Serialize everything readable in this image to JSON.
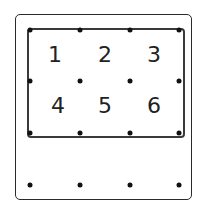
{
  "diagram": {
    "title": "",
    "digits": [
      {
        "label": "1",
        "x": 55,
        "y": 55
      },
      {
        "label": "2",
        "x": 105,
        "y": 55
      },
      {
        "label": "3",
        "x": 154,
        "y": 55
      },
      {
        "label": "4",
        "x": 58,
        "y": 106
      },
      {
        "label": "5",
        "x": 105,
        "y": 106
      },
      {
        "label": "6",
        "x": 154,
        "y": 106
      }
    ],
    "dots": [
      {
        "x": 30,
        "y": 30
      },
      {
        "x": 80,
        "y": 30
      },
      {
        "x": 130,
        "y": 30
      },
      {
        "x": 179,
        "y": 30
      },
      {
        "x": 30,
        "y": 81
      },
      {
        "x": 80,
        "y": 81
      },
      {
        "x": 130,
        "y": 81
      },
      {
        "x": 179,
        "y": 81
      },
      {
        "x": 30,
        "y": 133
      },
      {
        "x": 80,
        "y": 133
      },
      {
        "x": 130,
        "y": 133
      },
      {
        "x": 179,
        "y": 133
      },
      {
        "x": 30,
        "y": 185
      },
      {
        "x": 80,
        "y": 185
      },
      {
        "x": 130,
        "y": 185
      },
      {
        "x": 179,
        "y": 185
      }
    ],
    "colors": {
      "stroke": "#2a2a2a",
      "dot": "#111111",
      "text": "#222222"
    }
  }
}
